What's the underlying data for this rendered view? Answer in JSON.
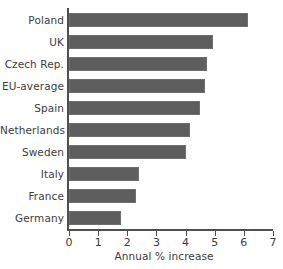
{
  "chart_data": {
    "type": "bar",
    "orientation": "horizontal",
    "title": "",
    "xlabel": "Annual % increase",
    "ylabel": "",
    "xlim": [
      0,
      7
    ],
    "xticks": [
      0,
      1,
      2,
      3,
      4,
      5,
      6,
      7
    ],
    "xtick_labels": [
      "0",
      "1",
      "2",
      "3",
      "4",
      "5",
      "6",
      "7"
    ],
    "grid": false,
    "legend": false,
    "bar_color": "#5e5e5e",
    "background_color": "#ffffff",
    "categories": [
      "Poland",
      "UK",
      "Czech Rep.",
      "EU-average",
      "Spain",
      "Netherlands",
      "Sweden",
      "Italy",
      "France",
      "Germany"
    ],
    "values": [
      6.15,
      4.95,
      4.75,
      4.65,
      4.5,
      4.15,
      4.0,
      2.4,
      2.3,
      1.8
    ]
  }
}
